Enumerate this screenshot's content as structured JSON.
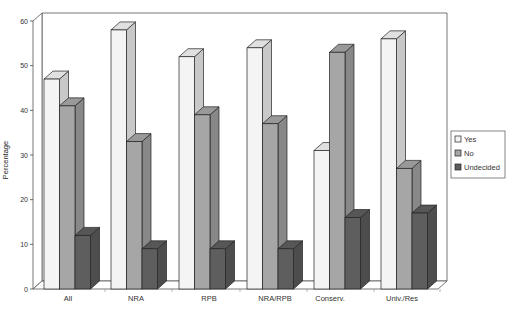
{
  "chart_data": {
    "type": "bar",
    "style": "3d-clustered-column",
    "title": "",
    "xlabel": "",
    "ylabel": "Percentage",
    "ylim": [
      0,
      60
    ],
    "yticks": [
      0,
      10,
      20,
      30,
      40,
      50,
      60
    ],
    "grid": false,
    "legend_position": "right",
    "categories": [
      "All",
      "NRA",
      "RPB",
      "NRA/RPB",
      "Conserv.",
      "Univ./Res"
    ],
    "series": [
      {
        "name": "Yes",
        "values": [
          47,
          58,
          52,
          54,
          31,
          56
        ],
        "color": "#f4f4f4"
      },
      {
        "name": "No",
        "values": [
          41,
          33,
          39,
          37,
          53,
          27
        ],
        "color": "#a6a6a6"
      },
      {
        "name": "Undecided",
        "values": [
          12,
          9,
          9,
          9,
          16,
          17
        ],
        "color": "#5e5e5e"
      }
    ]
  },
  "legend": {
    "items": [
      "Yes",
      "No",
      "Undecided"
    ]
  }
}
